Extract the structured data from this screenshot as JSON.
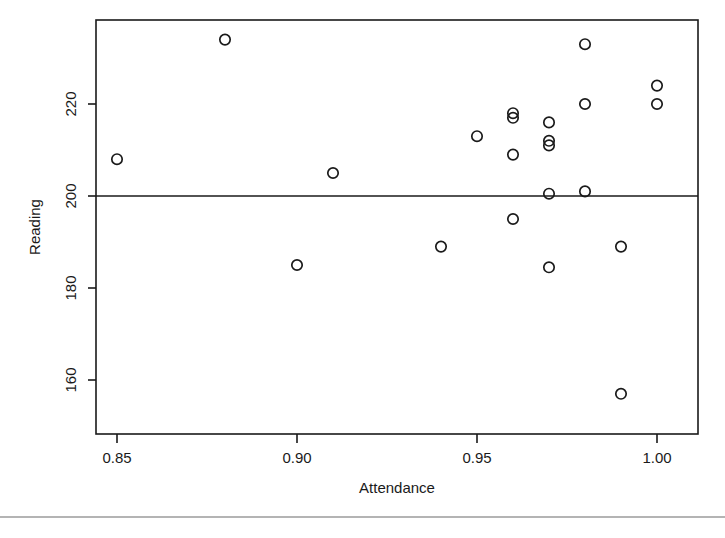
{
  "chart_data": {
    "type": "scatter",
    "title": "",
    "xlabel": "Attendance",
    "ylabel": "Reading",
    "xlim": [
      0.8415,
      1.0085
    ],
    "ylim": [
      153.5,
      236.5
    ],
    "xticks": [
      0.85,
      0.9,
      0.95,
      1.0
    ],
    "xtick_labels": [
      "0.85",
      "0.90",
      "0.95",
      "1.00"
    ],
    "yticks": [
      160,
      180,
      200,
      220
    ],
    "ytick_labels": [
      "160",
      "180",
      "200",
      "220"
    ],
    "grid": false,
    "legend": null,
    "marker": "open-circle",
    "point_color": "#1a1a1a",
    "reference_line": {
      "orientation": "horizontal",
      "y": 201.2,
      "color": "#1a1a1a"
    },
    "x": [
      0.85,
      0.88,
      0.9,
      0.91,
      0.94,
      0.95,
      0.96,
      0.96,
      0.96,
      0.96,
      0.97,
      0.97,
      0.97,
      0.97,
      0.97,
      0.98,
      0.98,
      0.98,
      0.99,
      0.99,
      1.0,
      1.0
    ],
    "y": [
      208,
      234,
      185,
      205,
      189,
      213,
      218,
      217,
      209,
      195,
      216,
      212,
      211,
      200.5,
      184.5,
      233,
      220,
      201,
      189,
      157,
      224,
      220
    ],
    "points": [
      {
        "x": 0.85,
        "y": 208
      },
      {
        "x": 0.88,
        "y": 234
      },
      {
        "x": 0.9,
        "y": 185
      },
      {
        "x": 0.91,
        "y": 205
      },
      {
        "x": 0.94,
        "y": 189
      },
      {
        "x": 0.95,
        "y": 213
      },
      {
        "x": 0.96,
        "y": 218
      },
      {
        "x": 0.96,
        "y": 217
      },
      {
        "x": 0.96,
        "y": 209
      },
      {
        "x": 0.96,
        "y": 195
      },
      {
        "x": 0.97,
        "y": 216
      },
      {
        "x": 0.97,
        "y": 212
      },
      {
        "x": 0.97,
        "y": 211
      },
      {
        "x": 0.97,
        "y": 200.5
      },
      {
        "x": 0.97,
        "y": 184.5
      },
      {
        "x": 0.98,
        "y": 233
      },
      {
        "x": 0.98,
        "y": 220
      },
      {
        "x": 0.98,
        "y": 201
      },
      {
        "x": 0.99,
        "y": 189
      },
      {
        "x": 0.99,
        "y": 157
      },
      {
        "x": 1.0,
        "y": 224
      },
      {
        "x": 1.0,
        "y": 220
      }
    ]
  },
  "axes": {
    "x_title": "Attendance",
    "y_title": "Reading",
    "x_tick_0": "0.85",
    "x_tick_1": "0.90",
    "x_tick_2": "0.95",
    "x_tick_3": "1.00",
    "y_tick_0": "160",
    "y_tick_1": "180",
    "y_tick_2": "200",
    "y_tick_3": "220"
  }
}
